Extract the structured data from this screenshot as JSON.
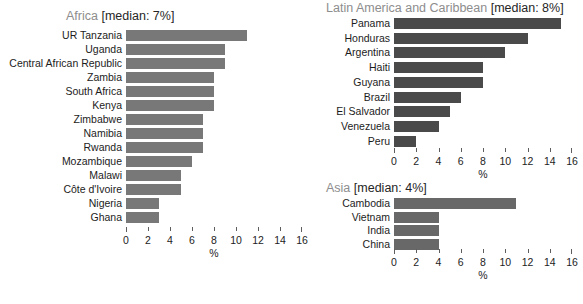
{
  "figure": {
    "axis_title": "%",
    "bar_color_africa": "#787878",
    "bar_color_latam": "#4a4a4a",
    "bar_color_asia": "#686868",
    "axis_color": "#5e5e5e",
    "title_region_color": "#8d8d8d",
    "title_median_color": "#262626"
  },
  "panels": {
    "africa": {
      "title_region": "Africa",
      "title_median": "[median: 7%]",
      "median": 7
    },
    "latam": {
      "title_region": "Latin America and Caribbean",
      "title_median": "[median: 8%]",
      "median": 8
    },
    "asia": {
      "title_region": "Asia",
      "title_median": "[median: 4%]",
      "median": 4
    }
  },
  "chart_data": [
    {
      "type": "bar",
      "orientation": "horizontal",
      "title": "Africa [median: 7%]",
      "xlabel": "%",
      "ylabel": "",
      "xlim": [
        0,
        16
      ],
      "xticks": [
        0,
        2,
        4,
        6,
        8,
        10,
        12,
        14,
        16
      ],
      "xticklabels": [
        "0",
        "2",
        "4",
        "6",
        "8",
        "10",
        "12",
        "14",
        "16"
      ],
      "grid": false,
      "legend": false,
      "categories": [
        "UR Tanzania",
        "Uganda",
        "Central African Republic",
        "Zambia",
        "South Africa",
        "Kenya",
        "Zimbabwe",
        "Namibia",
        "Rwanda",
        "Mozambique",
        "Malawi",
        "Côte d'Ivoire",
        "Nigeria",
        "Ghana"
      ],
      "values": [
        11,
        9,
        9,
        8,
        8,
        8,
        7,
        7,
        7,
        6,
        5,
        5,
        3,
        3
      ]
    },
    {
      "type": "bar",
      "orientation": "horizontal",
      "title": "Latin America and Caribbean [median: 8%]",
      "xlabel": "%",
      "ylabel": "",
      "xlim": [
        0,
        16
      ],
      "xticks": [
        0,
        2,
        4,
        6,
        8,
        10,
        12,
        14,
        16
      ],
      "xticklabels": [
        "0",
        "2",
        "4",
        "6",
        "8",
        "10",
        "12",
        "14",
        "16"
      ],
      "grid": false,
      "legend": false,
      "categories": [
        "Panama",
        "Honduras",
        "Argentina",
        "Haiti",
        "Guyana",
        "Brazil",
        "El Salvador",
        "Venezuela",
        "Peru"
      ],
      "values": [
        15,
        12,
        10,
        8,
        8,
        6,
        5,
        4,
        2
      ]
    },
    {
      "type": "bar",
      "orientation": "horizontal",
      "title": "Asia [median: 4%]",
      "xlabel": "%",
      "ylabel": "",
      "xlim": [
        0,
        16
      ],
      "xticks": [
        0,
        2,
        4,
        6,
        8,
        10,
        12,
        14,
        16
      ],
      "xticklabels": [
        "0",
        "2",
        "4",
        "6",
        "8",
        "10",
        "12",
        "14",
        "16"
      ],
      "grid": false,
      "legend": false,
      "categories": [
        "Cambodia",
        "Vietnam",
        "India",
        "China"
      ],
      "values": [
        11,
        4,
        4,
        4
      ]
    }
  ]
}
